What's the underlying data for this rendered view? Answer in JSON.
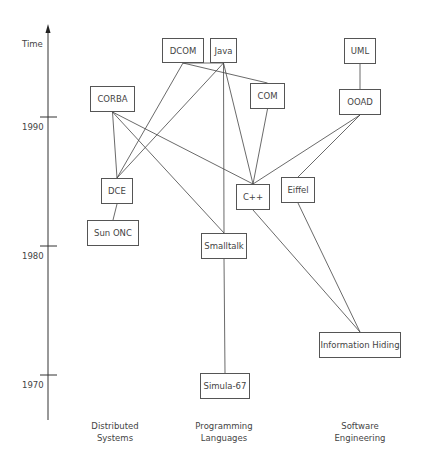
{
  "axis": {
    "title": "Time",
    "ticks": [
      {
        "label": "1990",
        "y": 117
      },
      {
        "label": "1980",
        "y": 246
      },
      {
        "label": "1970",
        "y": 375
      }
    ]
  },
  "columns": [
    {
      "label_line1": "Distributed",
      "label_line2": "Systems",
      "cx": 115
    },
    {
      "label_line1": "Programming",
      "label_line2": "Languages",
      "cx": 224
    },
    {
      "label_line1": "Software",
      "label_line2": "Engineering",
      "cx": 360
    }
  ],
  "nodes": {
    "dcom": {
      "label": "DCOM",
      "x": 162,
      "y": 38,
      "w": 42,
      "h": 25
    },
    "java": {
      "label": "Java",
      "x": 210,
      "y": 38,
      "w": 27,
      "h": 25
    },
    "uml": {
      "label": "UML",
      "x": 344,
      "y": 38,
      "w": 32,
      "h": 26
    },
    "corba": {
      "label": "CORBA",
      "x": 90,
      "y": 86,
      "w": 45,
      "h": 26
    },
    "com": {
      "label": "COM",
      "x": 250,
      "y": 83,
      "w": 35,
      "h": 26
    },
    "ooad": {
      "label": "OOAD",
      "x": 339,
      "y": 89,
      "w": 42,
      "h": 26
    },
    "dce": {
      "label": "DCE",
      "x": 101,
      "y": 178,
      "w": 32,
      "h": 26
    },
    "cpp": {
      "label": "C++",
      "x": 236,
      "y": 184,
      "w": 34,
      "h": 26
    },
    "eiffel": {
      "label": "Eiffel",
      "x": 281,
      "y": 177,
      "w": 34,
      "h": 26
    },
    "sunonc": {
      "label": "Sun ONC",
      "x": 87,
      "y": 220,
      "w": 52,
      "h": 26
    },
    "smalltalk": {
      "label": "Smalltalk",
      "x": 201,
      "y": 233,
      "w": 46,
      "h": 26
    },
    "infohiding": {
      "label": "Information Hiding",
      "x": 319,
      "y": 332,
      "w": 82,
      "h": 26
    },
    "simula": {
      "label": "Simula-67",
      "x": 200,
      "y": 373,
      "w": 50,
      "h": 26
    }
  },
  "edges": [
    {
      "from": "dcom",
      "to": "dce"
    },
    {
      "from": "dcom",
      "to": "com"
    },
    {
      "from": "java",
      "to": "dce"
    },
    {
      "from": "java",
      "to": "smalltalk"
    },
    {
      "from": "java",
      "to": "cpp"
    },
    {
      "from": "java",
      "to": "dcom"
    },
    {
      "from": "corba",
      "to": "dce"
    },
    {
      "from": "corba",
      "to": "cpp"
    },
    {
      "from": "corba",
      "to": "smalltalk"
    },
    {
      "from": "com",
      "to": "cpp"
    },
    {
      "from": "uml",
      "to": "ooad"
    },
    {
      "from": "ooad",
      "to": "cpp"
    },
    {
      "from": "ooad",
      "to": "eiffel"
    },
    {
      "from": "dce",
      "to": "sunonc"
    },
    {
      "from": "cpp",
      "to": "infohiding"
    },
    {
      "from": "eiffel",
      "to": "infohiding"
    },
    {
      "from": "smalltalk",
      "to": "simula"
    }
  ]
}
